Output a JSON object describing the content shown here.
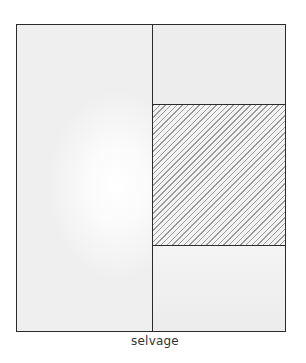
{
  "diagram": {
    "type": "fabric-cutting-layout",
    "caption": "selvage",
    "colors": {
      "outline": "#2b2b2b",
      "fabric_fill": "#ececec",
      "hatch_line": "#9a9a9a",
      "caption_text": "#333333"
    },
    "regions": [
      {
        "id": "left-panel",
        "fill": "plain"
      },
      {
        "id": "right-top-panel",
        "fill": "plain"
      },
      {
        "id": "right-middle-panel",
        "fill": "diagonal-hatch"
      },
      {
        "id": "right-bottom-panel",
        "fill": "plain"
      }
    ]
  }
}
